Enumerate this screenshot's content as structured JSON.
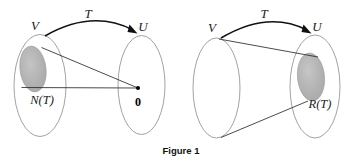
{
  "figure": {
    "caption": "Figure 1",
    "colors": {
      "shaded_region_fill": "#b2b2b2",
      "set_outline": "#8a8a8a",
      "map_line": "#2b2b2b",
      "arrow": "#111111",
      "background": "#ffffff",
      "text": "#1a1a1a"
    },
    "panels": [
      {
        "id": "null-space-panel",
        "map_label": "T",
        "domain_label": "V",
        "codomain_label": "U",
        "highlight_label": "N(T)",
        "target_label": "0",
        "description": "Null space N(T) in V maps to the zero vector 0 in U"
      },
      {
        "id": "range-panel",
        "map_label": "T",
        "domain_label": "V",
        "codomain_label": "U",
        "highlight_label": "R(T)",
        "description": "All of V maps onto the range R(T) inside U"
      }
    ]
  }
}
